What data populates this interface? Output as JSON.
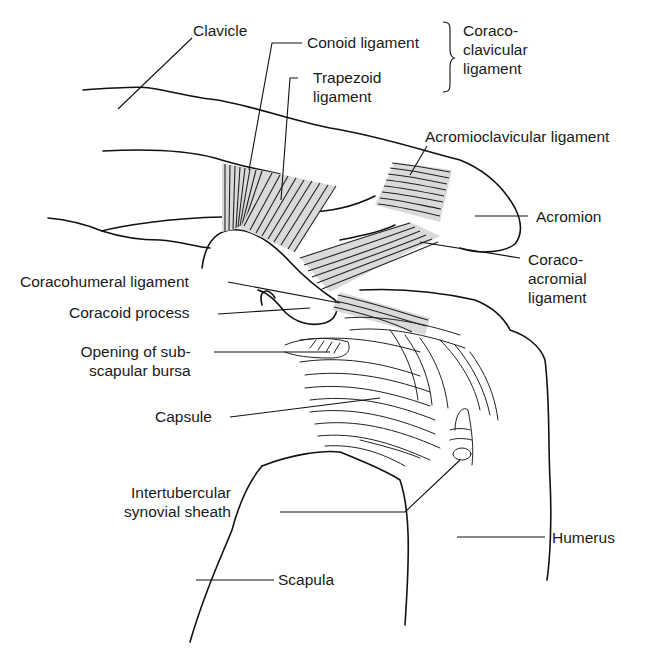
{
  "figure": {
    "colors": {
      "ink": "#111111",
      "ligament_fill": "#dadada",
      "background": "#ffffff"
    }
  },
  "labels": {
    "clavicle": "Clavicle",
    "conoid": "Conoid ligament",
    "coracoclavicular": [
      "Coraco-",
      "clavicular",
      "ligament"
    ],
    "trapezoid": [
      "Trapezoid",
      "ligament"
    ],
    "acromioclavicular": "Acromioclavicular ligament",
    "acromion": "Acromion",
    "coracoacromial": [
      "Coraco-",
      "acromial",
      "ligament"
    ],
    "coracohumeral": "Coracohumeral ligament",
    "coracoid_process": "Coracoid process",
    "subscapular_bursa": [
      "Opening of sub-",
      "scapular bursa"
    ],
    "capsule": "Capsule",
    "intertubercular": [
      "Intertubercular",
      "synovial sheath"
    ],
    "humerus": "Humerus",
    "scapula": "Scapula"
  }
}
